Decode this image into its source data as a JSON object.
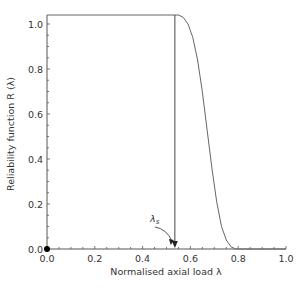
{
  "chart_data": {
    "type": "line",
    "title": "",
    "xlabel": "Normalised axial load λ",
    "ylabel": "Reliability function R (λ)",
    "xlim": [
      0,
      1.0
    ],
    "ylim": [
      0,
      1.04
    ],
    "x_ticks": [
      "0.0",
      "0.2",
      "0.4",
      "0.6",
      "0.8",
      "1.0"
    ],
    "y_ticks": [
      "0.0",
      "0.2",
      "0.4",
      "0.6",
      "0.8",
      "1.0"
    ],
    "grid": false,
    "legend": null,
    "series": [
      {
        "name": "R(λ)",
        "x": [
          0.0,
          0.5,
          0.55,
          0.57,
          0.59,
          0.61,
          0.63,
          0.65,
          0.67,
          0.69,
          0.71,
          0.73,
          0.75,
          0.77,
          0.79,
          0.8,
          1.0
        ],
        "values": [
          1.04,
          1.04,
          1.04,
          1.03,
          1.0,
          0.94,
          0.84,
          0.7,
          0.53,
          0.36,
          0.21,
          0.1,
          0.04,
          0.01,
          0.0,
          0.0,
          0.0
        ]
      }
    ],
    "annotations": [
      {
        "type": "vertical_line",
        "x": 0.535,
        "from_y": 0,
        "to_y": 1.04,
        "label": "λ_s",
        "arrow": "down"
      },
      {
        "type": "point",
        "x": 0.0,
        "y": 0.0,
        "marker": "filled-circle"
      },
      {
        "type": "horizontal_line",
        "y": 1.04,
        "from_x": 0.0,
        "to_x": 0.55
      }
    ]
  },
  "labels": {
    "annotation": "λ",
    "annotation_sub": "s"
  }
}
